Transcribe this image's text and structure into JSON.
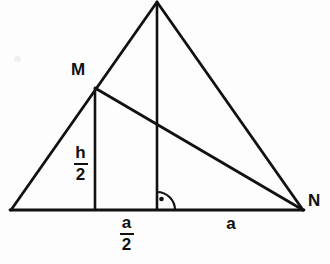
{
  "figure": {
    "type": "geometry-diagram",
    "background_color": "#fdfdfd",
    "stroke_color": "#111111",
    "stroke_width": 2.6
  },
  "points": {
    "left_base": {
      "name": "left-base-vertex",
      "x": 11,
      "y": 210,
      "label": ""
    },
    "apex": {
      "name": "apex-vertex",
      "x": 157,
      "y": 2,
      "label": ""
    },
    "right_base": {
      "name": "right-base-vertex",
      "x": 303,
      "y": 210,
      "label": "N"
    },
    "midpoint_left_side": {
      "name": "midpoint-m",
      "x": 95,
      "y": 88,
      "label": "M"
    },
    "foot_of_altitude": {
      "name": "foot-of-altitude",
      "x": 157,
      "y": 210,
      "label": ""
    },
    "foot_of_half_height": {
      "name": "foot-of-half-height",
      "x": 95,
      "y": 210,
      "label": ""
    }
  },
  "segments": [
    {
      "name": "base-line",
      "from": "left_base",
      "to": "right_base"
    },
    {
      "name": "left-side-line",
      "from": "left_base",
      "to": "apex"
    },
    {
      "name": "right-side-line",
      "from": "apex",
      "to": "right_base"
    },
    {
      "name": "altitude-line",
      "from": "apex",
      "to": "foot_of_altitude"
    },
    {
      "name": "half-height-line",
      "from": "midpoint_left_side",
      "to": "foot_of_half_height"
    },
    {
      "name": "median-mn-line",
      "from": "midpoint_left_side",
      "to": "right_base"
    }
  ],
  "labels": {
    "m_vertex": "M",
    "n_vertex": "N",
    "half_height": {
      "numerator": "h",
      "denominator": "2"
    },
    "half_base": {
      "numerator": "a",
      "denominator": "2"
    },
    "base_segment": "a"
  },
  "right_angle_marker": {
    "name": "right-angle-marker",
    "vertex_x": 157,
    "vertex_y": 210,
    "radius": 18,
    "dot_x": 161,
    "dot_y": 199,
    "dot_radius": 2.2
  }
}
